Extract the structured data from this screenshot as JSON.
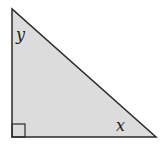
{
  "diagram": {
    "type": "right-triangle",
    "colors": {
      "fill": "#dcdcdc",
      "stroke": "#2a2a2a",
      "background": "#ffffff"
    },
    "vertices": {
      "top": [
        12,
        9
      ],
      "right_angle": [
        12,
        137
      ],
      "right": [
        156,
        137
      ]
    },
    "right_angle_marker": {
      "corner": "bottom-left",
      "size": 13
    },
    "angle_labels": [
      {
        "name": "top-angle",
        "text": "y",
        "x": 16,
        "y": 40
      },
      {
        "name": "bottom-right-angle",
        "text": "x",
        "x": 116,
        "y": 131
      }
    ]
  }
}
